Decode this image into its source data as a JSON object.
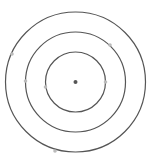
{
  "diagram": {
    "type": "concentric-circles",
    "caption": "",
    "center": {
      "x": 75.5,
      "y": 82,
      "color": "#555555",
      "r": 2
    },
    "circles": [
      {
        "name": "inner",
        "r": 30,
        "stroke": "#555555"
      },
      {
        "name": "middle",
        "r": 50,
        "stroke": "#555555"
      },
      {
        "name": "outer",
        "r": 70,
        "stroke": "#555555"
      }
    ],
    "points": [
      {
        "circle": "inner",
        "x": 105.5,
        "y": 82,
        "color": "#bbbbbb"
      },
      {
        "circle": "inner",
        "x": 45.5,
        "y": 87,
        "color": "#bbbbbb"
      },
      {
        "circle": "middle",
        "x": 25.5,
        "y": 81,
        "color": "#bbbbbb"
      },
      {
        "circle": "middle",
        "x": 110,
        "y": 45,
        "color": "#bbbbbb"
      },
      {
        "circle": "outer",
        "x": 12,
        "y": 54,
        "color": "#bbbbbb"
      },
      {
        "circle": "outer",
        "x": 55,
        "y": 151,
        "color": "#bbbbbb"
      }
    ]
  }
}
